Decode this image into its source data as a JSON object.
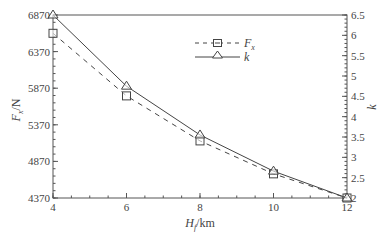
{
  "chart_data": {
    "type": "line",
    "title": "",
    "xlabel": "H_f/km",
    "xlabel_main": "H",
    "xlabel_sub": "f",
    "xlabel_unit": "/km",
    "ylabel": "F_x/N",
    "ylabel_main": "F",
    "ylabel_sub": "x",
    "ylabel_unit": "/N",
    "y2label": "k",
    "x": [
      4,
      6,
      8,
      10,
      12
    ],
    "xlim": [
      4,
      12
    ],
    "ylim": [
      4370,
      6870
    ],
    "y2lim": [
      2,
      6.5
    ],
    "xticks": [
      "4",
      "6",
      "8",
      "10",
      "12"
    ],
    "yticks": [
      "4370",
      "4870",
      "5370",
      "5870",
      "6370",
      "6870"
    ],
    "y2ticks": [
      "2",
      "2.5",
      "3",
      "3.5",
      "4",
      "4.5",
      "5",
      "5.5",
      "6",
      "6.5"
    ],
    "series": [
      {
        "name": "F_x",
        "axis": "left",
        "style": "dashed",
        "marker": "square",
        "values": [
          6620,
          5765,
          5150,
          4700,
          4370
        ]
      },
      {
        "name": "k",
        "axis": "right",
        "style": "solid",
        "marker": "triangle",
        "values": [
          6.5,
          4.75,
          3.55,
          2.66,
          2.0
        ]
      }
    ],
    "legend": {
      "position": "upper-center",
      "entries": [
        {
          "label_main": "F",
          "label_sub": "x"
        },
        {
          "label_main": "k",
          "label_sub": ""
        }
      ]
    },
    "grid": false
  }
}
